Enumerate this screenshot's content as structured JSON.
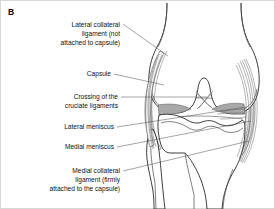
{
  "figure": {
    "panel_letter": "B",
    "view": "anterior view of right knee joint",
    "background_color": "#ffffff",
    "border_color": "#d7d7d7",
    "line_color": "#333333",
    "meniscus_color": "#a8a8a8",
    "capsule_color": "#e9e9e9"
  },
  "labels": [
    {
      "id": "lateral-collateral-ligament",
      "lines": [
        "Lateral collateral",
        "ligament (not",
        "attached to capsule)"
      ],
      "align": "right"
    },
    {
      "id": "capsule",
      "lines": [
        "Capsule"
      ],
      "align": "right"
    },
    {
      "id": "cruciate-ligaments",
      "lines": [
        "Crossing of the",
        "cruciate ligaments"
      ],
      "align": "right"
    },
    {
      "id": "lateral-meniscus",
      "lines": [
        "Lateral meniscus"
      ],
      "align": "right"
    },
    {
      "id": "medial-meniscus",
      "lines": [
        "Medial meniscus"
      ],
      "align": "right"
    },
    {
      "id": "medial-collateral-ligament",
      "lines": [
        "Medial collateral",
        "ligament (firmly",
        "attached to the capsule)"
      ],
      "align": "right"
    }
  ],
  "anatomy": [
    {
      "id": "femur",
      "name": "femur"
    },
    {
      "id": "tibia",
      "name": "tibia"
    },
    {
      "id": "fibula",
      "name": "fibula"
    },
    {
      "id": "joint-capsule",
      "name": "joint capsule"
    },
    {
      "id": "lateral-collateral-ligament",
      "name": "lateral collateral ligament"
    },
    {
      "id": "medial-collateral-ligament",
      "name": "medial collateral ligament"
    },
    {
      "id": "cruciate-ligaments",
      "name": "cruciate ligaments"
    },
    {
      "id": "lateral-meniscus",
      "name": "lateral meniscus"
    },
    {
      "id": "medial-meniscus",
      "name": "medial meniscus"
    }
  ]
}
